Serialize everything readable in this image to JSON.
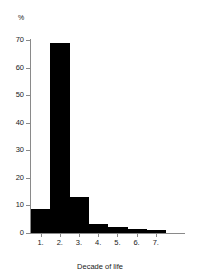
{
  "chart_data": {
    "type": "bar",
    "title": "",
    "subtitle": "",
    "xlabel": "Decade of life",
    "ylabel": "%",
    "categories": [
      "1.",
      "2.",
      "3.",
      "4.",
      "5.",
      "6.",
      "7."
    ],
    "values": [
      8.7,
      69.0,
      13.0,
      3.2,
      2.2,
      1.5,
      1.0
    ],
    "series": [
      {
        "name": "Percent of patients",
        "values": [
          8.7,
          69.0,
          13.0,
          3.2,
          2.2,
          1.5,
          1.0
        ]
      }
    ],
    "ylim": [
      0,
      70
    ],
    "yticks": [
      0,
      10,
      20,
      30,
      40,
      50,
      60,
      70
    ],
    "ytick_labels": [
      "0",
      "10",
      "20",
      "30",
      "40",
      "50",
      "60",
      "70"
    ],
    "xtick_labels": [
      "1.",
      "2.",
      "3.",
      "4.",
      "5.",
      "6.",
      "7."
    ],
    "grid": false,
    "legend": false,
    "legend_position": "none",
    "bar_color": "#000000",
    "axis_color": "#8a8a8a",
    "text_color": "#1a1a1a",
    "background": "#ffffff",
    "bar_style": "histogram-contiguous",
    "axis_extends_past_last_bar": true
  }
}
